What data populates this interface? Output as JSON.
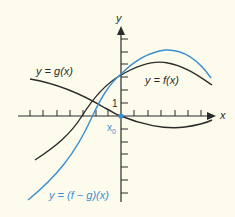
{
  "diagram": {
    "axes": {
      "x_label": "x",
      "y_label": "y",
      "unit_label": "1",
      "point_label": "x",
      "point_subscript": "0"
    },
    "curves": [
      {
        "name": "g",
        "label": "y = g(x)",
        "color": "#2b2b2b"
      },
      {
        "name": "f",
        "label": "y = f(x)",
        "color": "#2b2b2b"
      },
      {
        "name": "f-minus-g",
        "label": "y = (f − g)(x)",
        "color": "#3b8fd0"
      }
    ],
    "colors": {
      "background": "#fdfbec",
      "axis": "#2b2b2b",
      "accent": "#3b8fd0"
    }
  }
}
